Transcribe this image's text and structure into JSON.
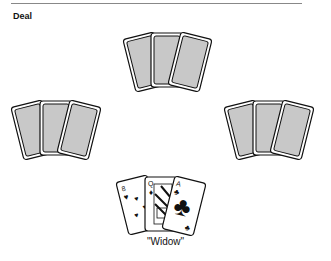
{
  "header": {
    "title": "Deal"
  },
  "hands": [
    {
      "position": "top",
      "cards": 3,
      "face": "down"
    },
    {
      "position": "left",
      "cards": 3,
      "face": "down"
    },
    {
      "position": "right",
      "cards": 3,
      "face": "down"
    },
    {
      "position": "bottom",
      "cards": 3,
      "face": "up",
      "label": "\"Widow\""
    }
  ],
  "widow": {
    "label": "\"Widow\"",
    "cards": [
      {
        "rank": "8",
        "suit": "hearts",
        "glyph": "♥"
      },
      {
        "rank": "Q",
        "suit": "diamonds",
        "glyph": "♦"
      },
      {
        "rank": "A",
        "suit": "clubs",
        "glyph": "♣"
      }
    ]
  },
  "colors": {
    "card_back": "#c8c8c8",
    "outline": "#111111",
    "rule": "#888888"
  }
}
